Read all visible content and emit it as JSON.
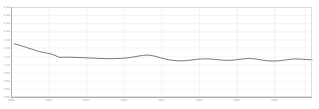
{
  "chart_data": {
    "type": "line",
    "title": "",
    "subtitle": "",
    "xlabel": "",
    "ylabel": "",
    "grid": true,
    "legend": false,
    "legend_position": "none",
    "line_color": "#555555",
    "grid_color": "#e8e8ee",
    "frame_color": "#b8b8b8",
    "background": "#ffffff",
    "axis_label_color": "#9a9a9a",
    "xlim": [
      0,
      100
    ],
    "ylim": [
      0,
      100
    ],
    "yticks": [
      0,
      9,
      18,
      27,
      36,
      45,
      55,
      64,
      73,
      82,
      91,
      100
    ],
    "ytick_labels": [
      "0.90",
      "0.95",
      "1.00",
      "1.05",
      "1.10",
      "1.15",
      "1.20",
      "1.25",
      "1.30",
      "1.35",
      "1.40",
      "1.45"
    ],
    "xticks": [
      0,
      12.5,
      25,
      37.5,
      50,
      62.5,
      75,
      87.5,
      97.5
    ],
    "xtick_labels": [
      "2009",
      "2010",
      "2011",
      "2012",
      "2013",
      "2014",
      "2015",
      "2016",
      ""
    ],
    "series": [
      {
        "name": "value",
        "color": "#555555",
        "x": [
          1.0,
          2.4,
          3.8,
          5.2,
          6.6,
          8.0,
          9.4,
          10.8,
          12.2,
          13.2,
          14.6,
          16.0,
          17.4,
          18.8,
          20.2,
          21.6,
          23.0,
          24.4,
          25.8,
          27.2,
          28.6,
          30.0,
          31.4,
          32.8,
          34.2,
          35.6,
          37.0,
          38.4,
          39.8,
          41.2,
          42.6,
          44.0,
          45.4,
          46.8,
          48.2,
          49.6,
          51.0,
          52.4,
          53.8,
          55.2,
          56.6,
          58.0,
          59.4,
          60.8,
          62.2,
          63.6,
          65.0,
          66.4,
          67.8,
          69.2,
          70.6,
          72.0,
          73.4,
          74.8,
          76.2,
          77.6,
          79.0,
          80.4,
          81.8,
          83.2,
          84.6,
          86.0,
          87.4,
          88.8,
          90.2,
          91.6,
          93.0,
          94.4,
          95.8,
          97.2,
          98.6,
          100.0
        ],
        "y": [
          59.0,
          58.0,
          56.5,
          55.0,
          53.5,
          52.0,
          50.5,
          49.5,
          48.6,
          47.8,
          46.3,
          44.0,
          44.2,
          44.3,
          44.1,
          44.0,
          43.8,
          43.6,
          43.4,
          43.2,
          43.0,
          42.8,
          42.7,
          42.6,
          42.6,
          42.8,
          43.0,
          43.4,
          44.0,
          44.8,
          45.6,
          46.3,
          46.6,
          46.0,
          45.0,
          43.6,
          42.4,
          41.4,
          40.7,
          40.3,
          40.2,
          40.4,
          40.9,
          41.5,
          42.0,
          42.3,
          42.4,
          42.2,
          41.8,
          41.3,
          40.9,
          40.7,
          40.9,
          41.4,
          42.0,
          42.5,
          42.8,
          42.6,
          42.0,
          41.2,
          40.5,
          40.1,
          40.0,
          40.2,
          40.7,
          41.4,
          42.0,
          42.3,
          42.2,
          41.8,
          41.5,
          41.6
        ]
      }
    ]
  },
  "axes": {
    "plot_left": 11,
    "plot_right": 312,
    "plot_top": 7,
    "plot_bottom": 97
  }
}
